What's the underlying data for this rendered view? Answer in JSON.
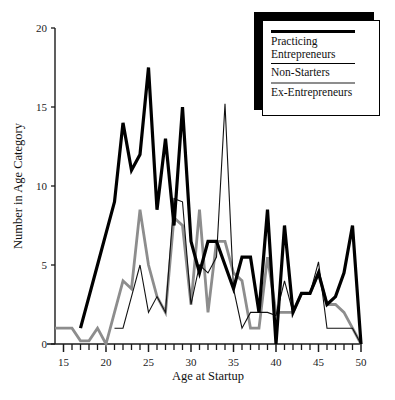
{
  "chart_data": {
    "type": "line",
    "title": "",
    "xlabel": "Age at Startup",
    "ylabel": "Number in Age Category",
    "xlim": [
      14,
      50
    ],
    "ylim": [
      0,
      20
    ],
    "xticks": [
      15,
      16,
      17,
      18,
      19,
      20,
      21,
      22,
      23,
      24,
      25,
      26,
      27,
      28,
      29,
      30,
      31,
      32,
      33,
      34,
      35,
      36,
      37,
      38,
      39,
      40,
      41,
      42,
      43,
      44,
      45,
      46,
      47,
      48,
      49,
      50
    ],
    "xtick_labels": [
      "15",
      "20",
      "25",
      "30",
      "35",
      "40",
      "45",
      "50"
    ],
    "xtick_label_values": [
      15,
      20,
      25,
      30,
      35,
      40,
      45,
      50
    ],
    "yticks": [
      0,
      5,
      10,
      15,
      20
    ],
    "ytick_labels": [
      "0",
      "5",
      "10",
      "15",
      "20"
    ],
    "grid": false,
    "legend_position": "top-right",
    "x": [
      14,
      15,
      16,
      17,
      18,
      19,
      20,
      21,
      22,
      23,
      24,
      25,
      26,
      27,
      28,
      29,
      30,
      31,
      32,
      33,
      34,
      35,
      36,
      37,
      38,
      39,
      40,
      41,
      42,
      43,
      44,
      45,
      46,
      47,
      48,
      49,
      50
    ],
    "series": [
      {
        "name": "Practicing Entrepreneurs",
        "color": "#000000",
        "style": "thick-black",
        "line_width": 3.2,
        "x": [
          17,
          18,
          19,
          20,
          21,
          22,
          23,
          24,
          25,
          26,
          27,
          28,
          29,
          30,
          31,
          32,
          33,
          34,
          35,
          36,
          37,
          38,
          39,
          40,
          41,
          42,
          43,
          44,
          45,
          46,
          47,
          48,
          49,
          50
        ],
        "values": [
          1,
          3,
          5,
          7,
          9,
          14,
          11,
          12,
          17.5,
          8.5,
          13,
          7.5,
          15,
          6.5,
          4.5,
          6.5,
          6.5,
          5,
          3.5,
          5.5,
          5.5,
          2,
          8.5,
          0,
          7.5,
          2,
          3.2,
          3.2,
          4.5,
          2.5,
          3,
          4.5,
          7.5,
          0
        ]
      },
      {
        "name": "Non-Starters",
        "color": "#111111",
        "style": "thin-black",
        "line_width": 1.1,
        "x": [
          21,
          22,
          23,
          24,
          25,
          26,
          27,
          28,
          29,
          30,
          31,
          32,
          33,
          34,
          35,
          36,
          37,
          38,
          39,
          40,
          41,
          42,
          43,
          44,
          45,
          46,
          47,
          48,
          49,
          50
        ],
        "values": [
          1,
          1,
          3,
          5,
          2,
          3,
          2,
          9.2,
          9,
          2.5,
          5,
          4.5,
          5.5,
          15.2,
          3.5,
          1,
          2,
          2,
          2,
          1.8,
          4,
          2,
          3.2,
          3.2,
          5.2,
          1,
          1,
          1,
          1,
          0
        ]
      },
      {
        "name": "Ex-Entrepreneurs",
        "color": "#8d8d8d",
        "style": "grey",
        "line_width": 2.8,
        "x": [
          14,
          15,
          16,
          17,
          18,
          19,
          20,
          21,
          22,
          23,
          24,
          25,
          26,
          27,
          28,
          29,
          30,
          31,
          32,
          33,
          34,
          35,
          36,
          37,
          38,
          39,
          40,
          41,
          42,
          43,
          44,
          45,
          46,
          47,
          48,
          49,
          50
        ],
        "values": [
          1,
          1,
          1,
          0.2,
          0.2,
          1,
          0,
          2,
          4,
          3.5,
          8.5,
          5,
          3,
          2,
          8,
          7.5,
          2.5,
          8.5,
          2,
          6.5,
          6.5,
          4.5,
          4,
          1,
          1,
          5.5,
          2,
          2,
          2,
          3.2,
          3.2,
          4.5,
          2.5,
          2.5,
          2,
          1,
          0
        ]
      }
    ]
  },
  "legend": {
    "entries": [
      {
        "label": "Practicing\nEntrepreneurs",
        "swatch": "thick-black-line"
      },
      {
        "label": "Non-Starters",
        "swatch": "thin-black-line"
      },
      {
        "label": "Ex-Entrepreneurs",
        "swatch": "grey-line"
      }
    ]
  },
  "axes": {
    "x_title": "Age at Startup",
    "y_title": "Number in Age Category",
    "x_labels": [
      "15",
      "20",
      "25",
      "30",
      "35",
      "40",
      "45",
      "50"
    ],
    "y_labels": [
      "0",
      "5",
      "10",
      "15",
      "20"
    ]
  }
}
